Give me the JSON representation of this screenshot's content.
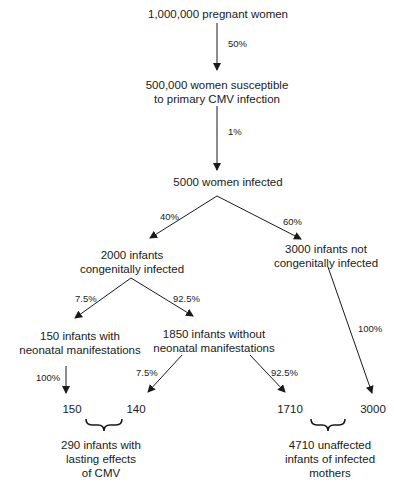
{
  "nodes": {
    "pregnant": "1,000,000 pregnant women",
    "susceptible_l1": "500,000 women susceptible",
    "susceptible_l2": "to primary CMV infection",
    "infected": "5000 women infected",
    "congenital_l1": "2000 infants",
    "congenital_l2": "congenitally infected",
    "not_congenital_l1": "3000 infants not",
    "not_congenital_l2": "congenitally infected",
    "with_manif_l1": "150 infants with",
    "with_manif_l2": "neonatal manifestations",
    "without_manif_l1": "1850 infants without",
    "without_manif_l2": "neonatal manifestations",
    "outcome_150": "150",
    "outcome_140": "140",
    "outcome_1710": "1710",
    "outcome_3000": "3000",
    "lasting_l1": "290 infants with",
    "lasting_l2": "lasting effects",
    "lasting_l3": "of CMV",
    "unaffected_l1": "4710 unaffected",
    "unaffected_l2": "infants of infected",
    "unaffected_l3": "mothers"
  },
  "edges": {
    "pregnant_to_susceptible": "50%",
    "susceptible_to_infected": "1%",
    "infected_to_congenital": "40%",
    "infected_to_not_congenital": "60%",
    "congenital_to_with_manif": "7.5%",
    "congenital_to_without_manif": "92.5%",
    "with_manif_to_150": "100%",
    "without_manif_to_140": "7.5%",
    "without_manif_to_1710": "92.5%",
    "not_congenital_to_3000": "100%"
  }
}
